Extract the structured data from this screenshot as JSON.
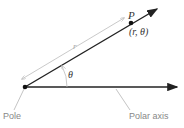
{
  "diagram": {
    "labels": {
      "point": "P",
      "coords": "(r, θ)",
      "radius": "r",
      "angle": "θ",
      "pole": "Pole",
      "axis": "Polar axis"
    },
    "colors": {
      "line": "#222222",
      "guide": "#bbbbbb",
      "label": "#888888"
    }
  }
}
